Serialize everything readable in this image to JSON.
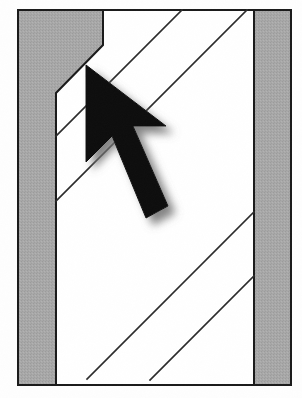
{
  "image": {
    "kind": "scanned-line-diagram",
    "title": "Hatched channel cross-section with pointer cursor",
    "width": 302,
    "height": 398,
    "background_color": "#ffffff"
  },
  "palette": {
    "paper": "#ffffff",
    "gray_fill": "#a8a8a8",
    "gray_fill_dark": "#9d9d9d",
    "outline": "#1a1a1a",
    "hatch_line": "#2b2b2b",
    "cursor_fill": "#111111",
    "cursor_shadow": "#9a9a9a"
  },
  "frame": {
    "label": "outer drawing frame",
    "left": 18,
    "top": 10,
    "right": 291,
    "bottom": 385,
    "stroke_width": 2
  },
  "shapes": {
    "left_band": {
      "label": "left hatched wall band with upper notch",
      "fill": "gray_fill",
      "points": "18,10 103,10 103,45 56,93 56,385 18,385"
    },
    "right_band": {
      "label": "right hatched wall band",
      "fill": "gray_fill",
      "points": "254,10 291,10 291,385 254,385"
    },
    "white_channel": {
      "label": "white channel between the two bands",
      "fill": "paper",
      "points": "103,10 254,10 254,385 56,385 56,93"
    }
  },
  "hatch_lines": [
    {
      "name": "hatch-line-1",
      "x1": 182,
      "y1": 10,
      "x2": 56,
      "y2": 136
    },
    {
      "name": "hatch-line-2",
      "x1": 247,
      "y1": 10,
      "x2": 56,
      "y2": 201
    },
    {
      "name": "hatch-line-3",
      "x1": 254,
      "y1": 212,
      "x2": 87,
      "y2": 379
    },
    {
      "name": "hatch-line-4",
      "x1": 254,
      "y1": 276,
      "x2": 150,
      "y2": 380
    }
  ],
  "cursor": {
    "label": "mouse pointer arrow",
    "direction": "up-left",
    "tip": {
      "x": 86,
      "y": 65
    },
    "tail": {
      "x": 150,
      "y": 216
    },
    "shadow_offset": {
      "x": 7,
      "y": 7
    },
    "shadow_blur": 5,
    "outline_points": "86,65 86,162 112,136 146,218 168,206 133,126 166,126"
  }
}
